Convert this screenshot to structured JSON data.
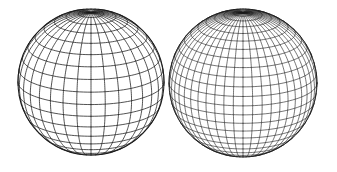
{
  "figure": {
    "width": 337,
    "height": 172,
    "background": "#ffffff",
    "line_color": "#1a1a1a"
  },
  "spheres": [
    {
      "name": "coarse-wireframe-sphere",
      "cx": 91,
      "cy": 82,
      "r": 73,
      "tilt_deg": 18,
      "latitude_bands": 18,
      "meridians": 32,
      "stroke_width": 0.75
    },
    {
      "name": "fine-wireframe-sphere",
      "cx": 243,
      "cy": 83,
      "r": 74,
      "tilt_deg": 18,
      "latitude_bands": 24,
      "meridians": 48,
      "stroke_width": 0.6
    }
  ]
}
